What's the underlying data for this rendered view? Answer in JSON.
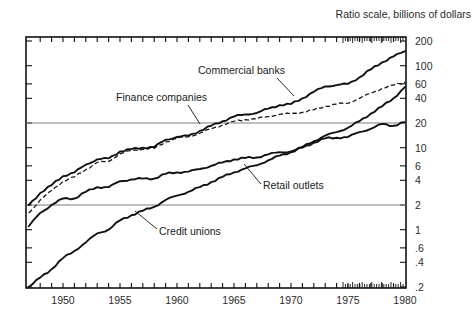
{
  "chart_data": {
    "type": "line",
    "title": "Ratio scale, billions of dollars",
    "xlabel": "",
    "ylabel": "",
    "scale": "log",
    "grid": "two horizontal reference lines at 20 and 2",
    "legend_position": "inline-annotations-with-leader-lines",
    "xlim": [
      1947,
      1980
    ],
    "ylim": [
      0.2,
      200
    ],
    "xticks": [
      1950,
      1955,
      1960,
      1965,
      1970,
      1975,
      1980
    ],
    "xtick_labels": [
      "1950",
      "1955",
      "1960",
      "1965",
      "1970",
      "1975",
      "1980"
    ],
    "yticks": [
      200,
      100,
      60,
      40,
      20,
      10,
      6,
      4,
      2,
      1,
      0.6,
      0.4,
      0.2
    ],
    "ytick_labels": [
      "200",
      "100",
      "60",
      "40",
      "20",
      "10",
      "6",
      "4",
      "2",
      "1",
      ".6",
      ".4",
      ".2"
    ],
    "gridline_values": [
      20,
      2
    ],
    "series": [
      {
        "name": "Commercial banks",
        "style": "solid",
        "x": [
          1947,
          1948,
          1949,
          1950,
          1951,
          1952,
          1953,
          1954,
          1955,
          1956,
          1957,
          1958,
          1959,
          1960,
          1961,
          1962,
          1963,
          1964,
          1965,
          1966,
          1967,
          1968,
          1969,
          1970,
          1971,
          1972,
          1973,
          1974,
          1975,
          1976,
          1977,
          1978,
          1979,
          1980
        ],
        "values": [
          2.0,
          2.8,
          3.5,
          4.5,
          5.0,
          6.2,
          7.2,
          7.4,
          9.0,
          9.6,
          10.0,
          10.2,
          12.5,
          13.5,
          14.0,
          16.0,
          18.5,
          21.0,
          24.0,
          25.5,
          26.5,
          30.0,
          33.0,
          34.0,
          40.0,
          48.0,
          56.0,
          58.0,
          60.0,
          72.0,
          90.0,
          110.0,
          130.0,
          150.0
        ]
      },
      {
        "name": "Finance companies",
        "style": "dashed",
        "x": [
          1947,
          1948,
          1949,
          1950,
          1951,
          1952,
          1953,
          1954,
          1955,
          1956,
          1957,
          1958,
          1959,
          1960,
          1961,
          1962,
          1963,
          1964,
          1965,
          1966,
          1967,
          1968,
          1969,
          1970,
          1971,
          1972,
          1973,
          1974,
          1975,
          1976,
          1977,
          1978,
          1979,
          1980
        ],
        "values": [
          1.6,
          2.3,
          3.0,
          3.9,
          4.4,
          5.4,
          6.6,
          6.8,
          8.4,
          9.2,
          9.6,
          9.8,
          11.8,
          13.0,
          13.6,
          15.0,
          17.0,
          19.0,
          21.0,
          22.0,
          22.5,
          24.0,
          25.5,
          26.0,
          27.0,
          29.0,
          32.0,
          34.0,
          35.0,
          40.0,
          46.0,
          53.0,
          58.0,
          63.0
        ]
      },
      {
        "name": "Credit unions",
        "style": "solid",
        "x": [
          1947,
          1948,
          1949,
          1950,
          1951,
          1952,
          1953,
          1954,
          1955,
          1956,
          1957,
          1958,
          1959,
          1960,
          1961,
          1962,
          1963,
          1964,
          1965,
          1966,
          1967,
          1968,
          1969,
          1970,
          1971,
          1972,
          1973,
          1974,
          1975,
          1976,
          1977,
          1978,
          1979,
          1980
        ],
        "values": [
          0.2,
          0.26,
          0.33,
          0.45,
          0.55,
          0.7,
          0.9,
          1.0,
          1.3,
          1.5,
          1.7,
          1.9,
          2.3,
          2.6,
          2.9,
          3.3,
          3.8,
          4.4,
          5.0,
          5.6,
          6.1,
          7.0,
          8.0,
          8.8,
          10.2,
          12.0,
          14.0,
          15.5,
          17.5,
          21.0,
          26.0,
          32.0,
          40.0,
          55.0
        ]
      },
      {
        "name": "Retail outlets",
        "style": "solid",
        "x": [
          1947,
          1948,
          1949,
          1950,
          1951,
          1952,
          1953,
          1954,
          1955,
          1956,
          1957,
          1958,
          1959,
          1960,
          1961,
          1962,
          1963,
          1964,
          1965,
          1966,
          1967,
          1968,
          1969,
          1970,
          1971,
          1972,
          1973,
          1974,
          1975,
          1976,
          1977,
          1978,
          1979,
          1980
        ],
        "values": [
          1.1,
          1.6,
          2.0,
          2.4,
          2.4,
          2.9,
          3.3,
          3.3,
          3.9,
          4.1,
          4.2,
          4.2,
          4.8,
          5.0,
          5.1,
          5.5,
          6.0,
          6.6,
          7.2,
          7.5,
          7.6,
          8.3,
          8.8,
          9.0,
          10.0,
          11.5,
          13.0,
          13.2,
          13.5,
          15.5,
          17.0,
          19.5,
          18.5,
          20.5
        ]
      }
    ],
    "annotations": [
      {
        "text": "Commercial banks",
        "x": 198,
        "y": 74
      },
      {
        "text": "Finance companies",
        "x": 116,
        "y": 101
      },
      {
        "text": "Retail outlets",
        "x": 263,
        "y": 189
      },
      {
        "text": "Credit unions",
        "x": 159,
        "y": 235
      }
    ]
  }
}
